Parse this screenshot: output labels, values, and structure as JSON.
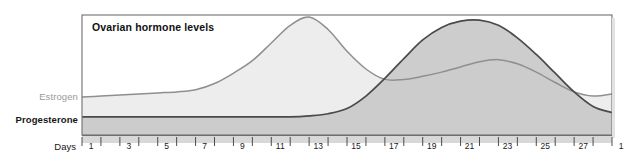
{
  "chart_data": {
    "type": "area",
    "title": "Ovarian hormone levels",
    "xlabel": "Days",
    "ylabel": "",
    "grid": false,
    "legend_position": "left-axis-labels",
    "axis": {
      "x_min_day": 1,
      "x_max_day": 29,
      "tick_step_days": 1,
      "labeled_tick_step_days": 2,
      "tick_labels": [
        "1",
        "3",
        "5",
        "7",
        "9",
        "11",
        "13",
        "15",
        "17",
        "19",
        "21",
        "23",
        "25",
        "27",
        "1"
      ],
      "tick_label_days": [
        1,
        3,
        5,
        7,
        9,
        11,
        13,
        15,
        17,
        19,
        21,
        23,
        25,
        27,
        29
      ],
      "y_axis_visible_scale": false
    },
    "series": [
      {
        "name": "Estrogen",
        "color": "#8f8f8f",
        "fill": "#ededed",
        "label_color": "#9a9a9a",
        "annotation": "Biphasic: a large preovulatory peak around day 13 and a smaller luteal peak near day 22.",
        "x": [
          1,
          2,
          3,
          4,
          5,
          6,
          7,
          8,
          9,
          10,
          11,
          12,
          13,
          14,
          15,
          16,
          17,
          18,
          19,
          20,
          21,
          22,
          23,
          24,
          25,
          26,
          27,
          28,
          29
        ],
        "values": [
          23,
          24,
          25,
          26,
          27,
          28,
          30,
          36,
          46,
          58,
          75,
          92,
          100,
          88,
          67,
          50,
          40,
          40,
          43,
          47,
          52,
          57,
          59,
          55,
          47,
          37,
          28,
          24,
          26
        ]
      },
      {
        "name": "Progesterone",
        "color": "#4a4a4a",
        "fill": "#c9c9c9",
        "label_color": "#161616",
        "annotation": "Flat and low through the follicular phase, rising sharply after ovulation to a luteal peak near day 22, then falling.",
        "x": [
          1,
          2,
          3,
          4,
          5,
          6,
          7,
          8,
          9,
          10,
          11,
          12,
          13,
          14,
          15,
          16,
          17,
          18,
          19,
          20,
          21,
          22,
          23,
          24,
          25,
          26,
          27,
          28,
          29
        ],
        "values": [
          4,
          4,
          4,
          4,
          4,
          4,
          4,
          4,
          4,
          4,
          4,
          4,
          5,
          7,
          12,
          24,
          41,
          60,
          78,
          90,
          96,
          97,
          92,
          80,
          64,
          46,
          28,
          14,
          8
        ]
      }
    ]
  },
  "labels": {
    "title": "Ovarian hormone levels",
    "estrogen": "Estrogen",
    "progesterone": "Progesterone",
    "days": "Days"
  },
  "colors": {
    "estrogen_line": "#8f8f8f",
    "estrogen_fill": "#ededed",
    "progesterone_line": "#4a4a4a",
    "progesterone_fill": "#c9c9c9",
    "plot_border": "#6f6f6f",
    "axis_band": "#d8d8d8",
    "background": "#ffffff"
  }
}
